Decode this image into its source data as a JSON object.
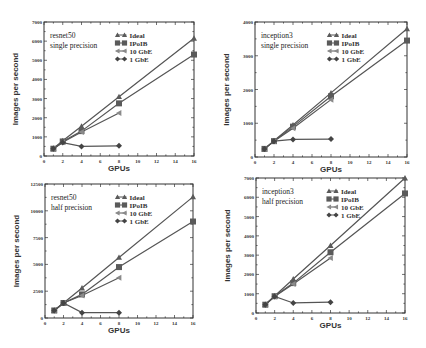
{
  "chart_data": [
    {
      "type": "line",
      "title": "resnet50 single precision",
      "annotation": [
        "resnet50",
        "single precision"
      ],
      "xlabel": "GPUs",
      "ylabel": "Images per second",
      "x": [
        1,
        2,
        4,
        8,
        16
      ],
      "xlim": [
        0,
        16
      ],
      "xticks": [
        0,
        2,
        4,
        6,
        8,
        10,
        12,
        14,
        16
      ],
      "ylim": [
        0,
        7000
      ],
      "yticks": [
        0,
        1000,
        2000,
        3000,
        4000,
        5000,
        6000,
        7000
      ],
      "grid": false,
      "legend_position": "upper-left-inside",
      "series": [
        {
          "name": "Ideal",
          "marker": "triangle",
          "values": [
            400,
            800,
            1550,
            3100,
            6150
          ]
        },
        {
          "name": "IPoIB",
          "marker": "square",
          "values": [
            380,
            760,
            1300,
            2750,
            5300
          ]
        },
        {
          "name": "10 GbE",
          "marker": "triangle-left",
          "values": [
            380,
            720,
            1250,
            2250,
            null
          ]
        },
        {
          "name": "1 GbE",
          "marker": "diamond",
          "values": [
            380,
            700,
            500,
            530,
            null
          ]
        }
      ]
    },
    {
      "type": "line",
      "title": "inception3 single precision",
      "annotation": [
        "inception3",
        "single precision"
      ],
      "xlabel": "GPUs",
      "ylabel": "Images per second",
      "x": [
        1,
        2,
        4,
        8,
        16
      ],
      "xlim": [
        0,
        16
      ],
      "xticks": [
        0,
        2,
        4,
        6,
        8,
        10,
        12,
        14,
        16
      ],
      "ylim": [
        0,
        4000
      ],
      "yticks": [
        0,
        1000,
        2000,
        3000,
        4000
      ],
      "grid": false,
      "legend_position": "upper-left-inside",
      "series": [
        {
          "name": "Ideal",
          "marker": "triangle",
          "values": [
            240,
            480,
            950,
            1900,
            3800
          ]
        },
        {
          "name": "IPoIB",
          "marker": "square",
          "values": [
            240,
            470,
            900,
            1800,
            3450
          ]
        },
        {
          "name": "10 GbE",
          "marker": "triangle-left",
          "values": [
            240,
            470,
            850,
            1700,
            null
          ]
        },
        {
          "name": "1 GbE",
          "marker": "diamond",
          "values": [
            240,
            470,
            520,
            530,
            null
          ]
        }
      ]
    },
    {
      "type": "line",
      "title": "resnet50 half precision",
      "annotation": [
        "resnet50",
        "half precision"
      ],
      "xlabel": "GPUs",
      "ylabel": "Images per second",
      "x": [
        1,
        2,
        4,
        8,
        16
      ],
      "xlim": [
        0,
        16
      ],
      "xticks": [
        0,
        2,
        4,
        6,
        8,
        10,
        12,
        14,
        16
      ],
      "ylim": [
        0,
        12500
      ],
      "yticks": [
        0,
        2500,
        5000,
        7500,
        10000,
        12500
      ],
      "grid": false,
      "legend_position": "upper-left-inside",
      "series": [
        {
          "name": "Ideal",
          "marker": "triangle",
          "values": [
            700,
            1400,
            2800,
            5650,
            11300
          ]
        },
        {
          "name": "IPoIB",
          "marker": "square",
          "values": [
            700,
            1400,
            2200,
            4750,
            9000
          ]
        },
        {
          "name": "10 GbE",
          "marker": "triangle-left",
          "values": [
            700,
            1400,
            2100,
            3750,
            null
          ]
        },
        {
          "name": "1 GbE",
          "marker": "diamond",
          "values": [
            700,
            1400,
            500,
            500,
            null
          ]
        }
      ]
    },
    {
      "type": "line",
      "title": "inception3 half precision",
      "annotation": [
        "inception3",
        "half precision"
      ],
      "xlabel": "GPUs",
      "ylabel": "Images per second",
      "x": [
        1,
        2,
        4,
        8,
        16
      ],
      "xlim": [
        0,
        16
      ],
      "xticks": [
        0,
        2,
        4,
        6,
        8,
        10,
        12,
        14,
        16
      ],
      "ylim": [
        0,
        7000
      ],
      "yticks": [
        0,
        1000,
        2000,
        3000,
        4000,
        5000,
        6000,
        7000
      ],
      "grid": false,
      "legend_position": "upper-left-inside",
      "series": [
        {
          "name": "Ideal",
          "marker": "triangle",
          "values": [
            440,
            880,
            1760,
            3500,
            7000
          ]
        },
        {
          "name": "IPoIB",
          "marker": "square",
          "values": [
            430,
            870,
            1550,
            3150,
            6200
          ]
        },
        {
          "name": "10 GbE",
          "marker": "triangle-left",
          "values": [
            430,
            860,
            1500,
            2850,
            null
          ]
        },
        {
          "name": "1 GbE",
          "marker": "diamond",
          "values": [
            430,
            860,
            520,
            560,
            null
          ]
        }
      ]
    }
  ],
  "style": {
    "line_color": "#555555",
    "marker_color": "#5a5a5a",
    "axis_color": "#333333",
    "background": "#ffffff"
  }
}
